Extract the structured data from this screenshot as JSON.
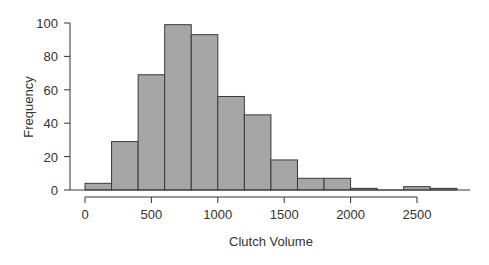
{
  "chart_data": {
    "type": "bar",
    "subtype": "histogram",
    "title": "",
    "xlabel": "Clutch Volume",
    "ylabel": "Frequency",
    "bin_width": 200,
    "bins": [
      [
        0,
        200
      ],
      [
        200,
        400
      ],
      [
        400,
        600
      ],
      [
        600,
        800
      ],
      [
        800,
        1000
      ],
      [
        1000,
        1200
      ],
      [
        1200,
        1400
      ],
      [
        1400,
        1600
      ],
      [
        1600,
        1800
      ],
      [
        1800,
        2000
      ],
      [
        2000,
        2200
      ],
      [
        2200,
        2400
      ],
      [
        2400,
        2600
      ],
      [
        2600,
        2800
      ]
    ],
    "values": [
      4,
      29,
      69,
      99,
      93,
      56,
      45,
      18,
      7,
      7,
      1,
      0,
      2,
      1
    ],
    "xlim": [
      0,
      2800
    ],
    "ylim": [
      0,
      100
    ],
    "xticks": [
      0,
      500,
      1000,
      1500,
      2000,
      2500
    ],
    "yticks": [
      0,
      20,
      40,
      60,
      80,
      100
    ],
    "grid": false,
    "legend": null,
    "colors": {
      "bar_fill": "#a6a6a6",
      "bar_edge": "#3a3a3a",
      "axis": "#333333"
    }
  }
}
